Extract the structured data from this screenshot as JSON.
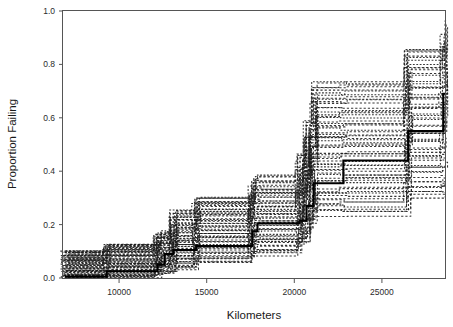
{
  "chart_data": {
    "type": "line",
    "title": "",
    "subtitle": "",
    "xlabel": "Kilometers",
    "ylabel": "Proportion Failing",
    "xlim": [
      6800,
      28600
    ],
    "ylim": [
      0.0,
      1.0
    ],
    "grid": false,
    "legend_position": "none",
    "xticks": [
      10000,
      15000,
      20000,
      25000
    ],
    "xtick_labels": [
      "10000",
      "15000",
      "20000",
      "25000"
    ],
    "yticks": [
      0.0,
      0.2,
      0.4,
      0.6,
      0.8,
      1.0
    ],
    "ytick_labels": [
      "0.0",
      "0.2",
      "0.4",
      "0.6",
      "0.8",
      "1.0"
    ],
    "style": {
      "estimate_color": "#000000",
      "replicate_color": "#1a1a1a",
      "frame_color": "#555555",
      "background": "#ffffff"
    },
    "series": [
      {
        "name": "estimate",
        "style": "solid",
        "x": [
          6900,
          9300,
          12200,
          12600,
          13100,
          14400,
          17600,
          17900,
          20300,
          20700,
          21100,
          22800,
          26500,
          28500
        ],
        "values": [
          0.005,
          0.025,
          0.05,
          0.09,
          0.105,
          0.12,
          0.175,
          0.205,
          0.215,
          0.27,
          0.355,
          0.44,
          0.55,
          0.69
        ]
      },
      {
        "name": "replicate-band-upper",
        "style": "dashed",
        "x": [
          6900,
          9300,
          12200,
          13100,
          14400,
          17600,
          20300,
          21100,
          22800,
          26500,
          28500
        ],
        "values": [
          0.105,
          0.13,
          0.175,
          0.255,
          0.31,
          0.385,
          0.47,
          0.6,
          0.74,
          0.87,
          0.98
        ]
      },
      {
        "name": "replicate-band-lower",
        "style": "dashed",
        "x": [
          6900,
          9300,
          12200,
          13100,
          14400,
          17600,
          20300,
          21100,
          22800,
          26500,
          28500
        ],
        "values": [
          0.0,
          0.0,
          0.015,
          0.03,
          0.055,
          0.085,
          0.12,
          0.175,
          0.235,
          0.3,
          0.3
        ]
      }
    ],
    "replicate_count": 60
  }
}
